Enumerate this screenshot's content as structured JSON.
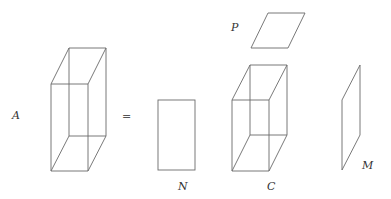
{
  "diagram": {
    "labels": {
      "A": "A",
      "equals": "=",
      "N": "N",
      "C": "C",
      "P": "P",
      "M": "M"
    },
    "colors": {
      "stroke": "#6a6a6a",
      "text": "#333333",
      "background": "#ffffff"
    }
  }
}
